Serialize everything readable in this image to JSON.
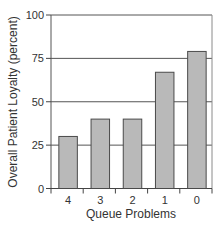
{
  "chart_data": {
    "type": "bar",
    "title": "",
    "xlabel": "Queue Problems",
    "ylabel": "Overall Patient Loyalty (percent)",
    "categories": [
      "4",
      "3",
      "2",
      "1",
      "0"
    ],
    "values": [
      30,
      40,
      40,
      67,
      79
    ],
    "ylim": [
      0,
      100
    ],
    "yticks": [
      0,
      25,
      50,
      75,
      100
    ],
    "grid": true,
    "legend": null
  },
  "colors": {
    "bar_fill": "#b9b9b9",
    "bar_stroke": "#4a4a4a",
    "grid": "#555555",
    "frame": "#8a8a8a",
    "text": "#333333"
  }
}
